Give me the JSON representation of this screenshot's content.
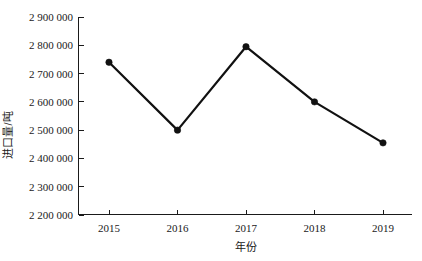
{
  "chart_data": {
    "type": "line",
    "title": "",
    "subtitle": "",
    "xlabel": "年份",
    "ylabel": "进口量/吨",
    "categories": [
      "2015",
      "2016",
      "2017",
      "2018",
      "2019"
    ],
    "x": [
      2015,
      2016,
      2017,
      2018,
      2019
    ],
    "values": [
      2740000,
      2500000,
      2795000,
      2600000,
      2455000
    ],
    "series": [
      {
        "name": "进口量",
        "values": [
          2740000,
          2500000,
          2795000,
          2600000,
          2455000
        ]
      }
    ],
    "ylim": [
      2200000,
      2900000
    ],
    "ytick_step": 100000,
    "ytick_labels": [
      "2 900 000",
      "2 800 000",
      "2 700 000",
      "2 600 000",
      "2 500 000",
      "2 400 000",
      "2 300 000",
      "2 200 000"
    ],
    "ytick_values": [
      2900000,
      2800000,
      2700000,
      2600000,
      2500000,
      2400000,
      2300000,
      2200000
    ],
    "xtick_labels": [
      "2015",
      "2016",
      "2017",
      "2018",
      "2019"
    ],
    "grid": false,
    "legend": false,
    "legend_position": "none",
    "marker": "filled-circle",
    "line_color": "#111111",
    "marker_color": "#111111",
    "axis_color": "#1a1a1a",
    "background_color": "#ffffff"
  },
  "axes": {
    "y_title": "进口量/吨",
    "x_title": "年份"
  },
  "ticks": {
    "y": [
      {
        "label": "2 900 000"
      },
      {
        "label": "2 800 000"
      },
      {
        "label": "2 700 000"
      },
      {
        "label": "2 600 000"
      },
      {
        "label": "2 500 000"
      },
      {
        "label": "2 400 000"
      },
      {
        "label": "2 300 000"
      },
      {
        "label": "2 200 000"
      }
    ],
    "x": [
      {
        "label": "2015"
      },
      {
        "label": "2016"
      },
      {
        "label": "2017"
      },
      {
        "label": "2018"
      },
      {
        "label": "2019"
      }
    ]
  }
}
